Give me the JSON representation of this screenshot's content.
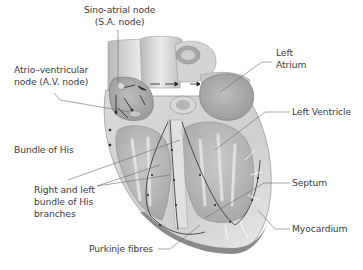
{
  "diagram": {
    "labels": {
      "sa_node": "Sino-atrial node\n(S.A. node)",
      "av_node": "Atrio–ventricular\nnode (A.V. node)",
      "left_atrium": "Left\nAtrium",
      "left_ventricle": "Left Ventricle",
      "bundle_of_his": "Bundle of His",
      "septum": "Septum",
      "bundle_branches": "Right and left\nbundle of His\nbranches",
      "myocardium": "Myocardium",
      "purkinje_fibres": "Purkinje fibres"
    },
    "colors": {
      "background": "#ffffff",
      "heart_light": "#e6e6e6",
      "heart_mid": "#c4c4c4",
      "heart_dark": "#8a8a8a",
      "leader_line": "#6a6a6a",
      "text": "#3c3c3c"
    }
  }
}
